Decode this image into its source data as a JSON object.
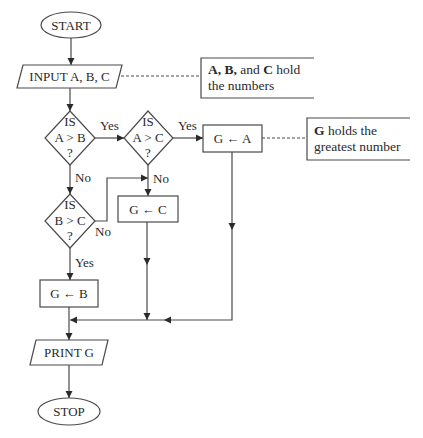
{
  "diagram": {
    "type": "flowchart",
    "nodes": {
      "start": {
        "shape": "terminator",
        "label": "START"
      },
      "input": {
        "shape": "io",
        "label": "INPUT A, B, C"
      },
      "decision_ab": {
        "shape": "decision",
        "line1": "IS",
        "line2": "A > B",
        "line3": "?"
      },
      "decision_ac": {
        "shape": "decision",
        "line1": "IS",
        "line2": "A > C",
        "line3": "?"
      },
      "decision_bc": {
        "shape": "decision",
        "line1": "IS",
        "line2": "B > C",
        "line3": "?"
      },
      "assign_a": {
        "shape": "process",
        "label": "G ← A"
      },
      "assign_c": {
        "shape": "process",
        "label": "G ← C"
      },
      "assign_b": {
        "shape": "process",
        "label": "G ← B"
      },
      "print": {
        "shape": "io",
        "label": "PRINT G"
      },
      "stop": {
        "shape": "terminator",
        "label": "STOP"
      }
    },
    "edge_labels": {
      "ab_yes": "Yes",
      "ab_no": "No",
      "ac_yes": "Yes",
      "ac_no": "No",
      "bc_no": "No",
      "bc_yes": "Yes"
    },
    "annotations": {
      "input_note": {
        "bold_a": "A,",
        "bold_b": "B,",
        "mid": "and",
        "bold_c": "C",
        "tail": "hold",
        "line2": "the numbers"
      },
      "result_note": {
        "bold_g": "G",
        "tail": "holds the",
        "line2": "greatest number"
      }
    },
    "edges": [
      {
        "from": "start",
        "to": "input"
      },
      {
        "from": "input",
        "to": "decision_ab"
      },
      {
        "from": "decision_ab",
        "to": "decision_ac",
        "label": "Yes"
      },
      {
        "from": "decision_ab",
        "to": "decision_bc",
        "label": "No"
      },
      {
        "from": "decision_ac",
        "to": "assign_a",
        "label": "Yes"
      },
      {
        "from": "decision_ac",
        "to": "assign_c",
        "label": "No"
      },
      {
        "from": "decision_bc",
        "to": "assign_c",
        "label": "No"
      },
      {
        "from": "decision_bc",
        "to": "assign_b",
        "label": "Yes"
      },
      {
        "from": "assign_a",
        "to": "print"
      },
      {
        "from": "assign_c",
        "to": "print"
      },
      {
        "from": "assign_b",
        "to": "print"
      },
      {
        "from": "print",
        "to": "stop"
      }
    ]
  }
}
